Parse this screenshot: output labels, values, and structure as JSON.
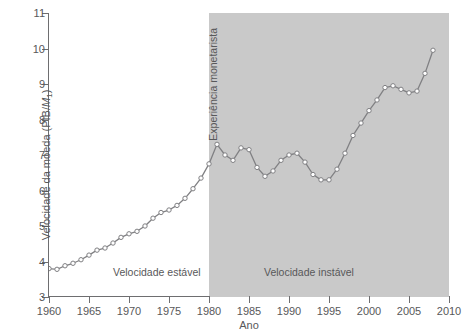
{
  "chart_data": {
    "type": "line",
    "title": "",
    "xlabel": "Ano",
    "ylabel": "Velocidade da moeda (PIB/M1)",
    "ylabel_parts": {
      "prefix": "Velocidade da moeda (PIB/",
      "italic": "M",
      "sub": "1",
      "suffix": ")"
    },
    "xlim": [
      1960,
      2010
    ],
    "ylim": [
      3,
      11
    ],
    "xticks": [
      1960,
      1965,
      1970,
      1975,
      1980,
      1985,
      1990,
      1995,
      2000,
      2005,
      2010
    ],
    "yticks": [
      3,
      4,
      5,
      6,
      7,
      8,
      9,
      10,
      11
    ],
    "grid": false,
    "legend": false,
    "marker": "circle",
    "series": [
      {
        "name": "Velocidade da moeda (PIB/M1)",
        "x": [
          1960,
          1961,
          1962,
          1963,
          1964,
          1965,
          1966,
          1967,
          1968,
          1969,
          1970,
          1971,
          1972,
          1973,
          1974,
          1975,
          1976,
          1977,
          1978,
          1979,
          1980,
          1981,
          1982,
          1983,
          1984,
          1985,
          1986,
          1987,
          1988,
          1989,
          1990,
          1991,
          1992,
          1993,
          1994,
          1995,
          1996,
          1997,
          1998,
          1999,
          2000,
          2001,
          2002,
          2003,
          2004,
          2005,
          2006,
          2007,
          2008
        ],
        "values": [
          3.8,
          3.78,
          3.88,
          3.95,
          4.05,
          4.18,
          4.32,
          4.38,
          4.52,
          4.68,
          4.78,
          4.85,
          5.0,
          5.22,
          5.38,
          5.45,
          5.58,
          5.78,
          6.05,
          6.35,
          6.75,
          7.3,
          7.0,
          6.85,
          7.2,
          7.15,
          6.65,
          6.4,
          6.55,
          6.85,
          7.0,
          7.05,
          6.8,
          6.45,
          6.3,
          6.3,
          6.6,
          7.05,
          7.55,
          7.9,
          8.25,
          8.55,
          8.9,
          8.95,
          8.85,
          8.75,
          8.8,
          9.3,
          9.95
        ]
      }
    ],
    "shaded_regions": [
      {
        "label": "Velocidade instável",
        "x_start": 1980,
        "x_end": 2010,
        "color": "#c9c9c9"
      }
    ],
    "annotations": [
      {
        "name": "stable-period",
        "text": "Velocidade estável"
      },
      {
        "name": "unstable-period",
        "text": "Velocidade instável"
      },
      {
        "name": "monetarist-experiment",
        "text": "Experiência monetarista",
        "rotation": -90
      }
    ],
    "colors": {
      "line": "#808083",
      "marker_face": "#ffffff",
      "marker_edge": "#808083",
      "shade": "#c9c9c9",
      "axis": "#6e6e70",
      "text": "#58585a",
      "background": "#ffffff"
    }
  }
}
